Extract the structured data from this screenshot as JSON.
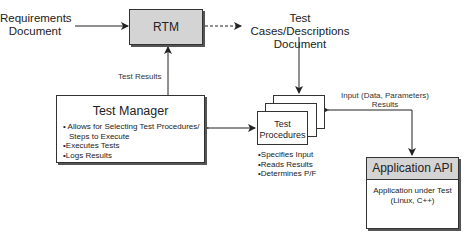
{
  "diagram": {
    "requirements_doc": {
      "line1": "Requirements",
      "line2": "Document"
    },
    "rtm": {
      "label": "RTM"
    },
    "test_cases_doc": {
      "line1": "Test Cases/Descriptions",
      "line2": "Document"
    },
    "test_results_label": "Test Results",
    "test_manager": {
      "title": "Test Manager",
      "items": [
        {
          "line1": "Allows for Selecting Test Procedures/",
          "line2": "Steps to Execute"
        },
        {
          "line1": "Executes Tests"
        },
        {
          "line1": "Logs Results"
        }
      ]
    },
    "test_procedures": {
      "line1": "Test",
      "line2": "Procedures",
      "items": [
        "Specifies Input",
        "Reads Results",
        "Determines P/F"
      ]
    },
    "api_link": {
      "line1": "Input (Data, Parameters)",
      "line2": "Results"
    },
    "application_api": {
      "title": "Application API",
      "body_line1": "Application under Test",
      "body_line2": "(Linux, C++)"
    },
    "colors": {
      "box_fill_shaded": "#d4d4d4",
      "stroke": "#333333",
      "background": "#ffffff"
    }
  }
}
